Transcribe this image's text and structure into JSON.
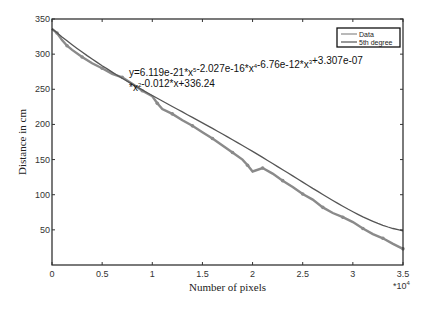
{
  "chart_data": {
    "type": "line",
    "title": "",
    "xlabel": "Number of pixels",
    "ylabel": "Distance in cm",
    "x_multiplier_label": "*10",
    "x_multiplier_exp": "4",
    "xlim": [
      0,
      3.5
    ],
    "ylim": [
      0,
      350
    ],
    "xticks": [
      "0",
      "0.5",
      "1",
      "1.5",
      "2",
      "2.5",
      "3",
      "3.5"
    ],
    "xtick_values": [
      0,
      0.5,
      1,
      1.5,
      2,
      2.5,
      3,
      3.5
    ],
    "yticks": [
      "50",
      "100",
      "150",
      "200",
      "250",
      "300",
      "350"
    ],
    "ytick_values": [
      50,
      100,
      150,
      200,
      250,
      300,
      350
    ],
    "grid": false,
    "legend_position": "top-right",
    "annotation": {
      "line1": "y=6.119e-21*x",
      "line1_parts": [
        {
          "t": "y=6.119e-21*x",
          "sup": "5"
        },
        {
          "t": "-2.027e-16*x",
          "sup": "4"
        },
        {
          "t": "-6.76e-12*x",
          "sup": "3"
        },
        {
          "t": "+3.307e-07",
          "sup": ""
        }
      ],
      "line2_parts": [
        {
          "t": "*x",
          "sup": "2"
        },
        {
          "t": "-0.012*x+336.24",
          "sup": ""
        }
      ]
    },
    "series": [
      {
        "name": "Data",
        "color": "#8a8a8a",
        "x": [
          0,
          0.05,
          0.1,
          0.15,
          0.2,
          0.3,
          0.4,
          0.5,
          0.6,
          0.7,
          0.8,
          0.9,
          1.0,
          1.05,
          1.1,
          1.2,
          1.3,
          1.4,
          1.5,
          1.6,
          1.7,
          1.8,
          1.9,
          1.95,
          2.0,
          2.1,
          2.2,
          2.3,
          2.4,
          2.5,
          2.6,
          2.7,
          2.8,
          2.9,
          3.0,
          3.1,
          3.2,
          3.3,
          3.4,
          3.5
        ],
        "y": [
          336,
          330,
          320,
          312,
          306,
          296,
          287,
          280,
          272,
          267,
          258,
          248,
          240,
          230,
          222,
          215,
          206,
          198,
          189,
          180,
          170,
          160,
          150,
          142,
          133,
          138,
          130,
          120,
          111,
          101,
          93,
          82,
          74,
          68,
          61,
          52,
          44,
          38,
          30,
          23
        ]
      },
      {
        "name": "5th degree",
        "color": "#555555",
        "coefficients": [
          6.119e-21,
          -2.027e-16,
          -6.76e-12,
          3.307e-07,
          -0.012,
          336.24
        ],
        "x_scale": 10000
      }
    ]
  },
  "footer_text": "11"
}
